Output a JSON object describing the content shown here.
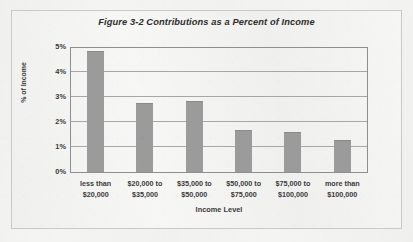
{
  "chart_data": {
    "type": "bar",
    "title": "Figure 3-2 Contributions as a Percent of Income",
    "xlabel": "Income Level",
    "ylabel": "% of Income",
    "categories": [
      "less than $20,000",
      "$20,000 to $35,000",
      "$35,000 to $50,000",
      "$50,000 to $75,000",
      "$75,000 to $100,000",
      "more than $100,000"
    ],
    "category_lines": [
      [
        "less than",
        "$20,000"
      ],
      [
        "$20,000 to",
        "$35,000"
      ],
      [
        "$35,000 to",
        "$50,000"
      ],
      [
        "$50,000 to",
        "$75,000"
      ],
      [
        "$75,000 to",
        "$100,000"
      ],
      [
        "more than",
        "$100,000"
      ]
    ],
    "values": [
      4.85,
      2.75,
      2.85,
      1.7,
      1.6,
      1.3
    ],
    "ylim": [
      0,
      5
    ],
    "ytick_values": [
      5,
      4,
      3,
      2,
      1,
      0
    ],
    "ytick_labels": [
      "5%",
      "4%",
      "3%",
      "2%",
      "1%",
      "0%"
    ],
    "grid": true,
    "legend": "none",
    "bar_color": "#9b9b9b",
    "axis_color": "#8e8e8e",
    "gridline_color": "#a7a7a7",
    "text_color": "#3a3a3a",
    "background_color": "#f2f2f0"
  }
}
